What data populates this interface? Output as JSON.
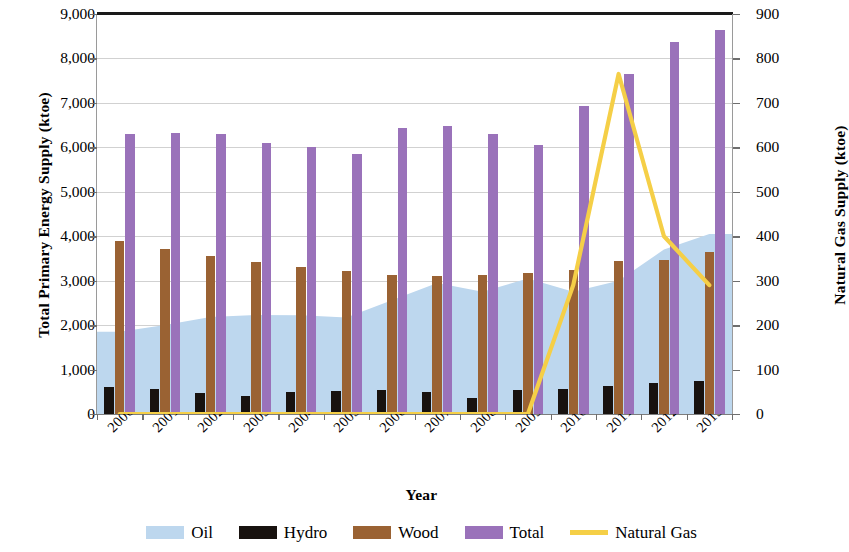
{
  "chart_data": {
    "type": "bar",
    "title": "",
    "xlabel": "Year",
    "ylabel": "Total Primary Energy Supply (ktoe)",
    "ylabel_secondary": "Natural Gas Supply (ktoe)",
    "categories": [
      "2000",
      "2001",
      "2002",
      "2003",
      "2004",
      "2005",
      "2006",
      "2007",
      "2008",
      "2009",
      "2010",
      "2011",
      "2012",
      "2013"
    ],
    "ylim": [
      0,
      9000
    ],
    "ylim_secondary": [
      0,
      900
    ],
    "yticks": [
      "0",
      "1,000",
      "2,000",
      "3,000",
      "4,000",
      "5,000",
      "6,000",
      "7,000",
      "8,000",
      "9,000"
    ],
    "ytick_values": [
      0,
      1000,
      2000,
      3000,
      4000,
      5000,
      6000,
      7000,
      8000,
      9000
    ],
    "yticks_secondary": [
      "0",
      "100",
      "200",
      "300",
      "400",
      "500",
      "600",
      "700",
      "800",
      "900"
    ],
    "ytick_values_secondary": [
      0,
      100,
      200,
      300,
      400,
      500,
      600,
      700,
      800,
      900
    ],
    "grid": true,
    "legend_position": "bottom",
    "series": [
      {
        "name": "Oil",
        "type": "area",
        "axis": "left",
        "color": "#bdd7ee",
        "values": [
          1850,
          2000,
          2180,
          2230,
          2220,
          2170,
          2560,
          2950,
          2750,
          3050,
          2750,
          3000,
          3700,
          4050
        ]
      },
      {
        "name": "Hydro",
        "type": "bar",
        "axis": "left",
        "color": "#18120f",
        "values": [
          600,
          570,
          480,
          400,
          490,
          520,
          530,
          500,
          370,
          540,
          570,
          630,
          690,
          750
        ]
      },
      {
        "name": "Wood",
        "type": "bar",
        "axis": "left",
        "color": "#9a6233",
        "values": [
          3900,
          3720,
          3560,
          3420,
          3300,
          3210,
          3130,
          3110,
          3120,
          3180,
          3250,
          3440,
          3460,
          3640
        ]
      },
      {
        "name": "Total",
        "type": "bar",
        "axis": "left",
        "color": "#9a72ba",
        "values": [
          6300,
          6320,
          6300,
          6090,
          6010,
          5860,
          6430,
          6470,
          6310,
          6060,
          6940,
          7650,
          8380,
          8630
        ]
      },
      {
        "name": "Natural Gas",
        "type": "line",
        "axis": "right",
        "color": "#f5cf47",
        "values": [
          0,
          0,
          0,
          0,
          0,
          0,
          0,
          0,
          0,
          0,
          290,
          765,
          400,
          290
        ]
      }
    ]
  },
  "axes": {
    "left_title": "Total Primary Energy Supply (ktoe)",
    "right_title": "Natural Gas Supply (ktoe)",
    "x_title": "Year"
  },
  "legend": {
    "items": [
      {
        "label": "Oil",
        "color": "#bdd7ee",
        "kind": "swatch"
      },
      {
        "label": "Hydro",
        "color": "#18120f",
        "kind": "swatch"
      },
      {
        "label": "Wood",
        "color": "#9a6233",
        "kind": "swatch"
      },
      {
        "label": "Total",
        "color": "#9a72ba",
        "kind": "swatch"
      },
      {
        "label": "Natural Gas",
        "color": "#f5cf47",
        "kind": "line"
      }
    ]
  }
}
